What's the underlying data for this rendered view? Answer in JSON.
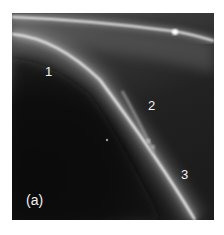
{
  "figure": {
    "panel_label": "(a)",
    "curve_labels": [
      "1",
      "2",
      "3"
    ],
    "colors": {
      "background": "#ffffff",
      "dark_region": "#0e0e0e",
      "mid_region": "#2a2a2a",
      "light_region": "#6a6a6a",
      "filament": "#f0f0f0",
      "label_text": "#f2f2f2"
    }
  }
}
